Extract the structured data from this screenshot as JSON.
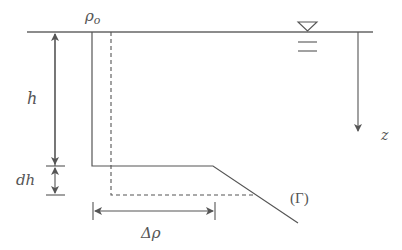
{
  "diagram": {
    "labels": {
      "rho_o": "ρo",
      "rho_sub": "o",
      "rho_main": "ρ",
      "h": "h",
      "dh": "dh",
      "delta_rho": "Δρ",
      "z": "z",
      "gamma": "(Γ)"
    },
    "colors": {
      "line": "#555555",
      "background": "#ffffff"
    },
    "elements": [
      "free-surface-line",
      "water-level-symbol",
      "solid-density-profile",
      "dashed-density-profile",
      "h-dimension-arrow",
      "dh-dimension-arrow",
      "delta-rho-dimension-arrow",
      "z-axis-arrow"
    ]
  }
}
